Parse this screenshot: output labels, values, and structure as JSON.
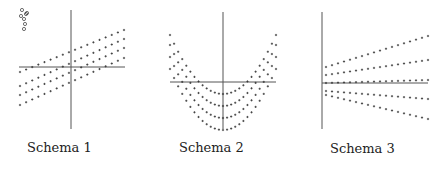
{
  "panels": [
    {
      "caption": "Schema 1",
      "type": "parallel-lines",
      "axis": {
        "cx": 71,
        "cy": 67,
        "x0": 19,
        "x1": 125,
        "y0": 10,
        "y1": 129
      },
      "x_range": [
        20,
        124
      ],
      "lines": [
        {
          "y_left": 72,
          "y_right": 30
        },
        {
          "y_left": 86,
          "y_right": 39
        },
        {
          "y_left": 95,
          "y_right": 48
        },
        {
          "y_left": 105,
          "y_right": 58
        }
      ],
      "points_per_line": 18,
      "circle_markers": [
        [
          22,
          10
        ],
        [
          26,
          14
        ],
        [
          21,
          16
        ],
        [
          24,
          19
        ],
        [
          27,
          13
        ],
        [
          25,
          24
        ],
        [
          24,
          29
        ]
      ],
      "caption_pos": [
        27,
        151
      ]
    },
    {
      "caption": "Schema 2",
      "type": "parabolas",
      "axis": {
        "cx": 223,
        "cy": 82,
        "x0": 170,
        "x1": 276,
        "y0": 12,
        "y1": 129
      },
      "x_range": [
        170,
        276
      ],
      "curves": [
        {
          "vertex_y": 94,
          "edge_y": 35
        },
        {
          "vertex_y": 106,
          "edge_y": 45
        },
        {
          "vertex_y": 118,
          "edge_y": 57
        },
        {
          "vertex_y": 130,
          "edge_y": 69
        }
      ],
      "points_per_curve": 27,
      "caption_pos": [
        179,
        151
      ]
    },
    {
      "caption": "Schema 3",
      "type": "fan-lines",
      "axis": {
        "cx": 322,
        "cy": 83,
        "x0": 322,
        "x1": 428,
        "y0": 12,
        "y1": 129
      },
      "x_range": [
        326,
        428
      ],
      "lines": [
        {
          "y_left": 67,
          "y_right": 36
        },
        {
          "y_left": 75,
          "y_right": 60
        },
        {
          "y_left": 83,
          "y_right": 80
        },
        {
          "y_left": 91,
          "y_right": 99
        },
        {
          "y_left": 95,
          "y_right": 119
        }
      ],
      "points_per_line": 18,
      "caption_pos": [
        330,
        152
      ]
    }
  ],
  "colors": {
    "axis": "#555555",
    "dot": "#333333",
    "text": "#222222"
  }
}
